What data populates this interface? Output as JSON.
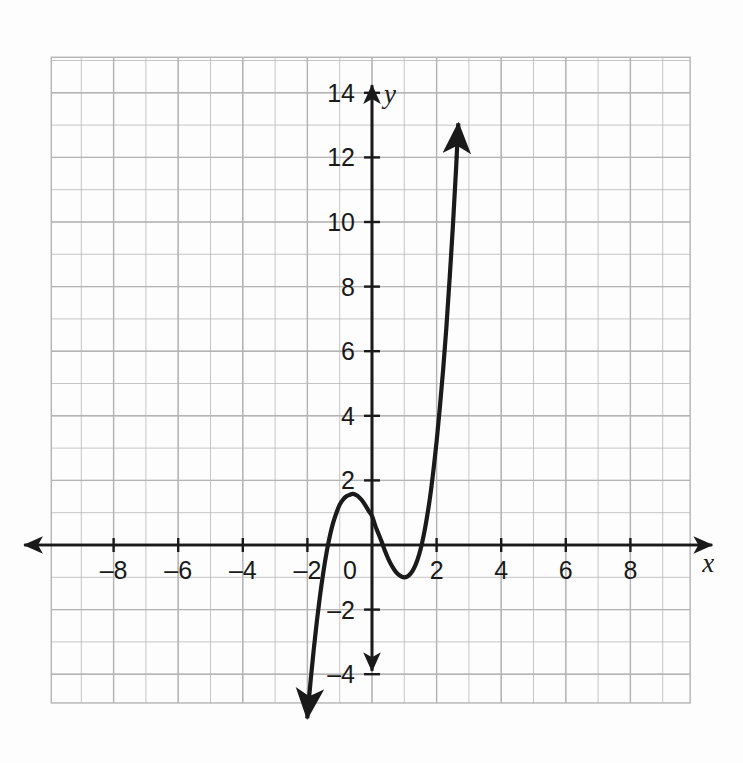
{
  "figure": {
    "background_color": "#fdfdfd",
    "grid_color": "#b4b4b4",
    "axis_color": "#1a1a1a",
    "curve_color": "#1a1a1a"
  },
  "axis_names": {
    "x": "x",
    "y": "y"
  },
  "origin_label": "0",
  "chart_data": {
    "type": "line",
    "title": "",
    "subtitle": "",
    "xlabel": "x",
    "ylabel": "y",
    "grid": true,
    "legend": "none",
    "xlim": [
      -9.9,
      9.9
    ],
    "ylim": [
      -5.1,
      15.1
    ],
    "xticks": [
      -8,
      -6,
      -4,
      -2,
      2,
      4,
      6,
      8
    ],
    "xtick_labels": [
      "–8",
      "–6",
      "–4",
      "–2",
      "2",
      "4",
      "6",
      "8"
    ],
    "yticks": [
      -4,
      -2,
      2,
      4,
      6,
      8,
      10,
      12,
      14
    ],
    "ytick_labels": [
      "–4",
      "–2",
      "2",
      "4",
      "6",
      "8",
      "10",
      "12",
      "14"
    ],
    "x_minor_step": 1,
    "y_minor_step": 1,
    "curve": {
      "name": "cubic",
      "roots": [
        -1.7,
        0.2,
        1.65
      ],
      "leading_coefficient": 1.6,
      "local_maximum": [
        -0.5,
        1.0
      ],
      "local_minimum": [
        1.0,
        -1.0
      ],
      "y_intercept": 0.9,
      "domain_drawn": [
        -1.95,
        2.62
      ],
      "arrow_start": [
        -1.95,
        -4.75
      ],
      "arrow_end": [
        2.62,
        15.0
      ],
      "arrows": "both",
      "points": [
        [
          -1.95,
          -4.75
        ],
        [
          -1.9,
          -4.2
        ],
        [
          -1.85,
          -3.7
        ],
        [
          -1.8,
          -3.2
        ],
        [
          -1.75,
          -2.75
        ],
        [
          -1.7,
          -2.3
        ],
        [
          -1.65,
          -1.9
        ],
        [
          -1.6,
          -1.5
        ],
        [
          -1.5,
          -0.8
        ],
        [
          -1.4,
          -0.2
        ],
        [
          -1.3,
          0.3
        ],
        [
          -1.2,
          0.7
        ],
        [
          -1.1,
          1.0
        ],
        [
          -1.0,
          1.25
        ],
        [
          -0.9,
          1.4
        ],
        [
          -0.8,
          1.5
        ],
        [
          -0.7,
          1.55
        ],
        [
          -0.6,
          1.58
        ],
        [
          -0.5,
          1.55
        ],
        [
          -0.4,
          1.48
        ],
        [
          -0.3,
          1.37
        ],
        [
          -0.2,
          1.22
        ],
        [
          -0.1,
          1.05
        ],
        [
          0.0,
          0.9
        ],
        [
          0.1,
          0.6
        ],
        [
          0.2,
          0.35
        ],
        [
          0.3,
          0.1
        ],
        [
          0.4,
          -0.18
        ],
        [
          0.5,
          -0.42
        ],
        [
          0.6,
          -0.62
        ],
        [
          0.7,
          -0.78
        ],
        [
          0.8,
          -0.9
        ],
        [
          0.9,
          -0.97
        ],
        [
          1.0,
          -1.0
        ],
        [
          1.1,
          -0.97
        ],
        [
          1.2,
          -0.88
        ],
        [
          1.3,
          -0.72
        ],
        [
          1.4,
          -0.48
        ],
        [
          1.5,
          -0.15
        ],
        [
          1.6,
          0.3
        ],
        [
          1.7,
          0.85
        ],
        [
          1.8,
          1.5
        ],
        [
          1.9,
          2.3
        ],
        [
          2.0,
          3.2
        ],
        [
          2.1,
          4.25
        ],
        [
          2.2,
          5.4
        ],
        [
          2.3,
          6.7
        ],
        [
          2.4,
          8.2
        ],
        [
          2.5,
          9.8
        ],
        [
          2.55,
          10.7
        ],
        [
          2.6,
          11.6
        ],
        [
          2.62,
          12.0
        ]
      ]
    }
  }
}
